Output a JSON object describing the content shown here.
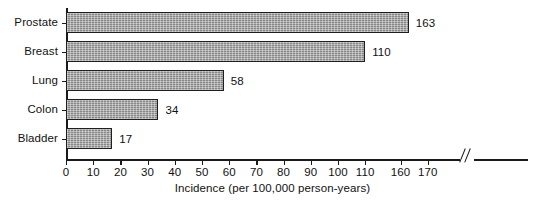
{
  "chart_data": {
    "type": "bar",
    "orientation": "horizontal",
    "title": "",
    "xlabel": "Incidence (per 100,000 person-years)",
    "ylabel": "",
    "categories": [
      "Prostate",
      "Breast",
      "Lung",
      "Colon",
      "Bladder"
    ],
    "values": [
      163,
      110,
      58,
      34,
      17
    ],
    "value_labels": [
      "163",
      "110",
      "58",
      "34",
      "17"
    ],
    "xlim": [
      0,
      170
    ],
    "xticks": [
      0,
      10,
      20,
      30,
      40,
      50,
      60,
      70,
      80,
      90,
      100,
      110,
      160,
      170
    ],
    "xtick_labels": [
      "0",
      "10",
      "20",
      "30",
      "40",
      "50",
      "60",
      "70",
      "80",
      "90",
      "100",
      "110",
      "160",
      "170"
    ],
    "axis_break": {
      "present": true,
      "between": [
        110,
        160
      ],
      "symbol": "double-slash"
    },
    "grid": false,
    "legend": null,
    "colors": {
      "bar_fill": "#9c9c9c",
      "bar_border": "#1f1f1f",
      "axis": "#1a1a1a",
      "text": "#111111",
      "background": "#ffffff"
    }
  }
}
